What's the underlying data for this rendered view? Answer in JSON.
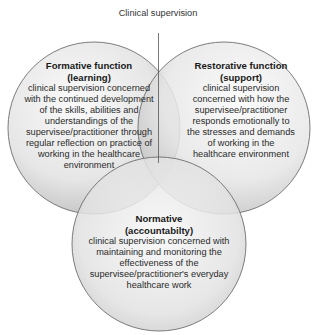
{
  "diagram": {
    "type": "venn",
    "top_label": "Clinical supervision",
    "colors": {
      "circle_fill_light": "#f4f4f4",
      "circle_fill_dark": "#bdbdbd",
      "circle_stroke": "#6e6e6e",
      "text": "#2a2a2a"
    },
    "circles": [
      {
        "id": "formative",
        "title": "Formative function (learning)",
        "title_lines": [
          "Formative function",
          "(learning)"
        ],
        "description": "clinical supervision concerned with the continued development of the skills, abilities and understandings of the supervisee/practitioner through regular reflection on practice of working in the healthcare environment"
      },
      {
        "id": "restorative",
        "title": "Restorative function (support)",
        "title_lines": [
          "Restorative function",
          "(support)"
        ],
        "description": "clinical supervision concerned with how the supervisee/practitioner responds emotionally to the stresses and demands of working in the healthcare environment"
      },
      {
        "id": "normative",
        "title": "Normative (accountabilty)",
        "title_lines": [
          "Normative",
          "(accountabilty)"
        ],
        "description": "clinical supervision concerned with maintaining and monitoring the effectiveness of the supervisee/practitioner's everyday healthcare work"
      }
    ]
  }
}
